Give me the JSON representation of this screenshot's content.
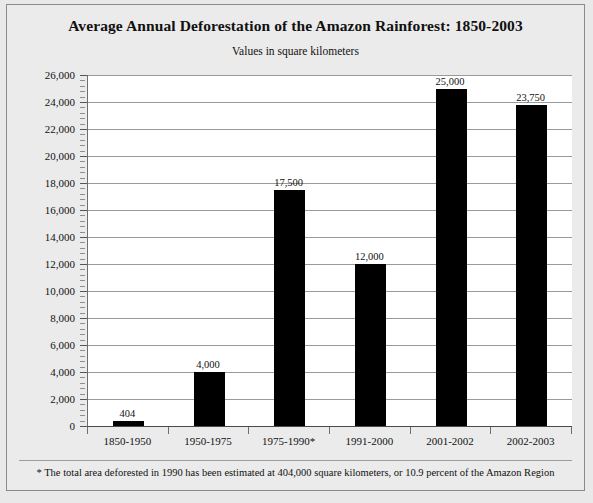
{
  "chart_data": {
    "type": "bar",
    "title": "Average Annual Deforestation of the Amazon Rainforest: 1850-2003",
    "subtitle": "Values in square kilometers",
    "xlabel": "",
    "ylabel": "",
    "categories": [
      "1850-1950",
      "1950-1975",
      "1975-1990*",
      "1991-2000",
      "2001-2002",
      "2002-2003"
    ],
    "values": [
      404,
      4000,
      17500,
      12000,
      25000,
      23750
    ],
    "value_labels": [
      "404",
      "4,000",
      "17,500",
      "12,000",
      "25,000",
      "23,750"
    ],
    "ylim": [
      0,
      26000
    ],
    "ytick_step": 2000,
    "yticks": [
      0,
      2000,
      4000,
      6000,
      8000,
      10000,
      12000,
      14000,
      16000,
      18000,
      20000,
      22000,
      24000,
      26000
    ],
    "ytick_labels": [
      "0",
      "2,000",
      "4,000",
      "6,000",
      "8,000",
      "10,000",
      "12,000",
      "14,000",
      "16,000",
      "18,000",
      "20,000",
      "22,000",
      "24,000",
      "26,000"
    ],
    "minor_ticks_per_interval": 4,
    "grid": true,
    "legend": null,
    "bar_color": "#000000",
    "plot_background": "#ffffff",
    "gridline_color": "#9a9a9a",
    "figure_background": "#ebebeb",
    "footnote": "* The total area deforested in 1990 has been estimated at 404,000 square kilometers, or 10.9 percent of the Amazon Region"
  }
}
